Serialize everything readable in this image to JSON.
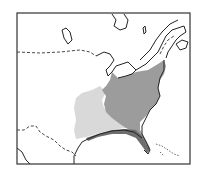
{
  "map": {
    "type": "range-map",
    "region": "Eastern North America",
    "colors": {
      "background": "#ffffff",
      "frame": "#333333",
      "coastline": "#222222",
      "border_dashed": "#333333",
      "range_primary": "#9c9c9c",
      "range_secondary": "#d9d9d9",
      "range_coastal": "#6e6e6e"
    },
    "layers": [
      {
        "name": "range-primary",
        "description": "dark gray core range, eastern US"
      },
      {
        "name": "range-secondary",
        "description": "light gray western extension"
      },
      {
        "name": "range-coastal",
        "description": "darker strip along Gulf coast and Florida"
      }
    ],
    "labels": []
  }
}
